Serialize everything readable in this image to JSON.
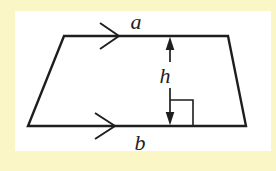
{
  "diagram": {
    "kind": "trapezoid-with-height",
    "labels": {
      "top_side": "a",
      "height": "h",
      "bottom_side": "b"
    },
    "colors": {
      "background": "#FAF6C5",
      "panel": "#FFFFFF",
      "line": "#1E1E1E",
      "label": "#1E1E1E"
    }
  }
}
